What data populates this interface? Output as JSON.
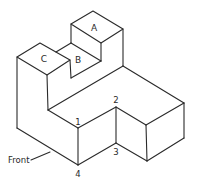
{
  "diagram": {
    "type": "isometric-drawing",
    "face_labels": {
      "a": "A",
      "b": "B",
      "c": "C"
    },
    "point_labels": {
      "p1": "1",
      "p2": "2",
      "p3": "3",
      "p4": "4"
    },
    "annotation": {
      "front": "Front"
    },
    "colors": {
      "line": "#2a2a2a",
      "background": "#ffffff"
    }
  }
}
